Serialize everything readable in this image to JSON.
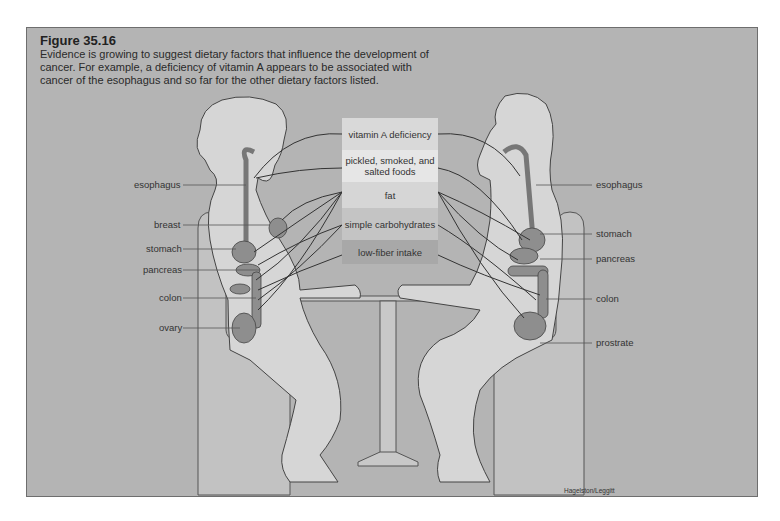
{
  "figure": {
    "title": "Figure 35.16",
    "caption": "Evidence is growing to suggest dietary factors that influence the development of cancer. For example, a deficiency of vitamin A appears to be associated with cancer of the esophagus and so far for the other dietary factors listed.",
    "credit": "Hagelston/Leggitt"
  },
  "factors": [
    {
      "label": "vitamin A deficiency",
      "color": "#d9d9d9",
      "height": 32
    },
    {
      "label": "pickled, smoked, and salted foods",
      "color": "#e6e6e6",
      "height": 32
    },
    {
      "label": "fat",
      "color": "#d6d6d6",
      "height": 26
    },
    {
      "label": "simple carbohydrates",
      "color": "#c4c4c4",
      "height": 32
    },
    {
      "label": "low-fiber intake",
      "color": "#a8a8a8",
      "height": 24
    }
  ],
  "left_labels": {
    "esophagus": "esophagus",
    "breast": "breast",
    "stomach": "stomach",
    "pancreas": "pancreas",
    "colon": "colon",
    "ovary": "ovary"
  },
  "right_labels": {
    "esophagus": "esophagus",
    "stomach": "stomach",
    "pancreas": "pancreas",
    "colon": "colon",
    "prostrate": "prostrate"
  },
  "colors": {
    "background": "#b4b4b4",
    "body": "#d4d4d4",
    "organ": "#8e8e8e",
    "line": "#333333"
  }
}
